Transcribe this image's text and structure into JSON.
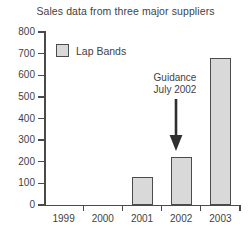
{
  "chart_data": {
    "type": "bar",
    "title": "Sales data from three major suppliers",
    "xlabel": "",
    "ylabel": "",
    "categories": [
      "1999",
      "2000",
      "2001",
      "2002",
      "2003"
    ],
    "series": [
      {
        "name": "Lap Bands",
        "values": [
          0,
          0,
          130,
          222,
          678
        ]
      }
    ],
    "ylim": [
      0,
      800
    ],
    "yticks": [
      0,
      100,
      200,
      300,
      400,
      500,
      600,
      700,
      800
    ],
    "ytick_labels": [
      "0",
      "100",
      "200",
      "300",
      "400",
      "500",
      "600",
      "700",
      "800"
    ],
    "grid": false,
    "legend": {
      "position": "upper-left-inside",
      "entries": [
        {
          "label": "Lap Bands",
          "color": "#d9d9d9",
          "edge_color": "#4c4c4c"
        }
      ]
    },
    "annotations": [
      {
        "name": "guidance-annotation",
        "line1": "Guidance",
        "line2": "July 2002",
        "points_to_category": "2002",
        "arrow": "down-arrow-icon"
      }
    ],
    "colors": {
      "bar_fill": "#d9d9d9",
      "bar_edge": "#4c4c4c",
      "axis": "#4a4a4a",
      "text": "#3f3f3f",
      "background": "#ffffff"
    }
  }
}
